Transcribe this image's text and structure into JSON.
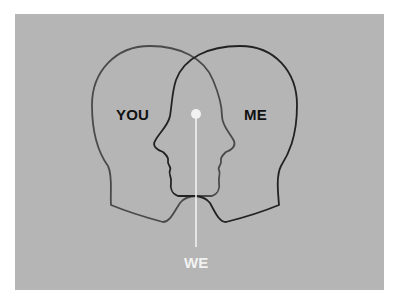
{
  "diagram": {
    "labels": {
      "you": "YOU",
      "me": "ME",
      "we": "WE"
    },
    "colors": {
      "background": "#b5b5b5",
      "left_head_stroke": "#4a4a4a",
      "right_head_stroke": "#222222",
      "label_dark": "#111111",
      "pointer": "#f2f2f2"
    },
    "elements": [
      {
        "id": "left-head",
        "label_ref": "you",
        "facing": "right"
      },
      {
        "id": "right-head",
        "label_ref": "me",
        "facing": "left"
      },
      {
        "id": "overlap-pointer",
        "label_ref": "we"
      }
    ]
  }
}
